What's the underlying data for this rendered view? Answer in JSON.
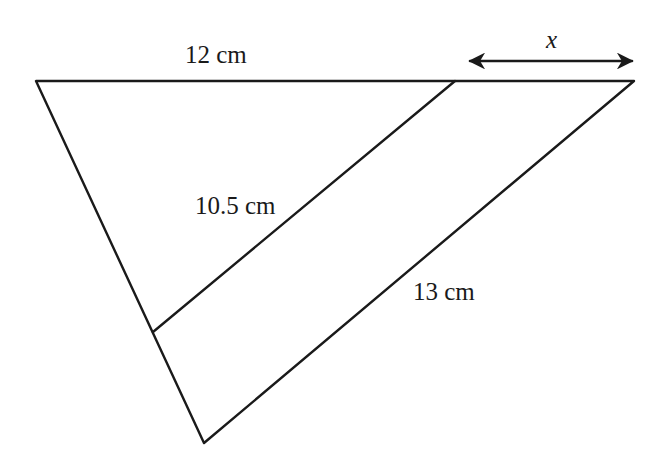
{
  "diagram": {
    "type": "similar-triangles",
    "labels": {
      "top_segment": "12 cm",
      "inner_parallel": "10.5 cm",
      "outer_side": "13 cm",
      "unknown": "x"
    },
    "vertices": {
      "top_left": [
        36,
        81
      ],
      "top_right": [
        634,
        81
      ],
      "bottom": [
        204,
        443
      ],
      "inner_top": [
        455,
        81
      ],
      "inner_bottom": [
        153,
        332
      ]
    },
    "colors": {
      "stroke": "#1a1a1a",
      "background": "#ffffff"
    }
  }
}
